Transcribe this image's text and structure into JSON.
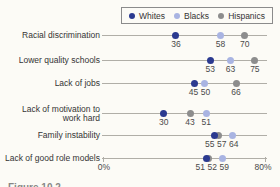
{
  "figure_caption": "Figure 10.2",
  "axis": {
    "min_label": "0%",
    "max_label": "80%"
  },
  "colors": {
    "line": "#b0aea7",
    "legend_border": "#8b8b8b",
    "category_text": "#343434",
    "value_text": "#4a4a4a",
    "background": "#fcfbf6"
  },
  "chart_data": {
    "type": "scatter",
    "title": "",
    "xlim": [
      0,
      80
    ],
    "grid": false,
    "legend_position": "top",
    "categories": [
      "Racial discrimination",
      "Lower quality schools",
      "Lack of jobs",
      "Lack of motivation to work hard",
      "Family instability",
      "Lack of good role models"
    ],
    "category_label_lines": [
      [
        "Racial discrimination"
      ],
      [
        "Lower quality schools"
      ],
      [
        "Lack of jobs"
      ],
      [
        "Lack of motivation to",
        "work hard"
      ],
      [
        "Family instability"
      ],
      [
        "Lack of good role models"
      ]
    ],
    "series": [
      {
        "name": "Whites",
        "color": "#2b3a90",
        "values": [
          36,
          53,
          45,
          30,
          55,
          51
        ]
      },
      {
        "name": "Blacks",
        "color": "#a9b4e2",
        "values": [
          58,
          63,
          50,
          51,
          64,
          59
        ]
      },
      {
        "name": "Hispanics",
        "color": "#8d8d8d",
        "values": [
          70,
          75,
          66,
          43,
          57,
          52
        ]
      }
    ]
  }
}
